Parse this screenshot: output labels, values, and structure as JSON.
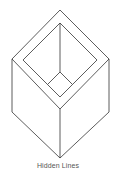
{
  "caption": "Hidden Lines",
  "colors": {
    "line": "#333333",
    "caption": "#555555",
    "background": "#ffffff"
  },
  "figure": {
    "type": "isometric-box-with-hidden-lines",
    "outer_top_face": [
      [
        60,
        10
      ],
      [
        109,
        59
      ],
      [
        60,
        109
      ],
      [
        12,
        59
      ]
    ],
    "inner_opening": [
      [
        60,
        23
      ],
      [
        97,
        60
      ],
      [
        60,
        97
      ],
      [
        23,
        60
      ]
    ],
    "inner_floor": [
      [
        60,
        72
      ],
      [
        72,
        84
      ],
      [
        60,
        97
      ],
      [
        48,
        84
      ]
    ],
    "back_edge": [
      [
        60,
        23
      ],
      [
        60,
        72
      ]
    ],
    "left_edge": [
      [
        12,
        59
      ],
      [
        12,
        112
      ]
    ],
    "right_edge": [
      [
        109,
        59
      ],
      [
        109,
        112
      ]
    ],
    "front_edge": [
      [
        60,
        109
      ],
      [
        60,
        158
      ]
    ],
    "bottom_left": [
      [
        12,
        112
      ],
      [
        60,
        158
      ]
    ],
    "bottom_right": [
      [
        109,
        112
      ],
      [
        60,
        158
      ]
    ]
  }
}
